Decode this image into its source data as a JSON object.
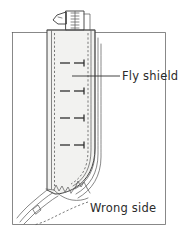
{
  "figure": {
    "kind": "sewing-instruction-line-drawing",
    "labels": {
      "fly_shield": "Fly shield",
      "wrong_side": "Wrong side"
    },
    "colors": {
      "ink": "#3a3a3a",
      "ink_light": "#5a5a5a",
      "panel_fill": "#f2f2f0",
      "garment_fill": "#ffffff",
      "text": "#2b2b2b",
      "background": "#ffffff"
    },
    "parts": [
      {
        "name": "garment-body-panel",
        "description": "Outer rectangular garment panel shown wrong side up"
      },
      {
        "name": "fly-shield-panel",
        "description": "Vertical shaded strip overlaying the garment centre front"
      },
      {
        "name": "zipper-assembly",
        "description": "Zipper tape with teeth and pull tab at top of fly"
      },
      {
        "name": "stitching-line-left",
        "description": "Dashed stitching line along left edge of fly shield"
      },
      {
        "name": "stitching-line-right",
        "description": "Dashed stitching line along right edge of fly shield"
      },
      {
        "name": "basting-marks",
        "description": "Four short arrow marks indicating basting direction"
      },
      {
        "name": "notched-seam-allowance",
        "description": "Zigzag clipped seam allowance at lower curve"
      }
    ],
    "basting_mark_count": 4,
    "leader_line": {
      "from": "fly-shield-panel",
      "to": "fly_shield-label"
    }
  }
}
